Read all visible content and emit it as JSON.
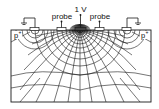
{
  "diagram": {
    "labels": {
      "voltage": "1 V",
      "probe_left": "probe",
      "probe_right": "probe",
      "doping_left": "p",
      "doping_left_sup": "+",
      "doping_right": "p",
      "doping_right_sup": "+"
    },
    "colors": {
      "line": "#1a1a1a",
      "background": "#ffffff",
      "contact": "#333333"
    }
  }
}
